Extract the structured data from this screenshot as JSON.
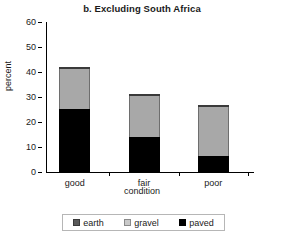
{
  "chart_data": {
    "type": "bar",
    "subtype": "stacked-bar",
    "title": "b. Excluding South Africa",
    "xlabel": "condition",
    "ylabel": "percent",
    "categories": [
      "good",
      "fair",
      "poor"
    ],
    "series": [
      {
        "name": "paved",
        "color": "#000000",
        "values": [
          25.2,
          14.0,
          6.4
        ]
      },
      {
        "name": "gravel",
        "color": "#a8a8a8",
        "values": [
          16.0,
          16.4,
          19.8
        ]
      },
      {
        "name": "earth",
        "color": "#5a5a5a",
        "values": [
          0.8,
          0.8,
          0.8
        ]
      }
    ],
    "totals": [
      42.0,
      31.2,
      27.0
    ],
    "ylim": [
      0,
      60
    ],
    "yticks": [
      0,
      10,
      20,
      30,
      40,
      50,
      60
    ],
    "ytick_labels": [
      "0",
      "10",
      "20",
      "30",
      "40",
      "50",
      "60"
    ],
    "grid": false,
    "legend_position": "bottom",
    "legend_entries": [
      "earth",
      "gravel",
      "paved"
    ]
  },
  "axes": {
    "y_title": "percent",
    "x_title": "condition"
  },
  "legend": {
    "items": [
      {
        "label": "earth",
        "swatch": "earth-swatch-icon"
      },
      {
        "label": "gravel",
        "swatch": "gravel-swatch-icon"
      },
      {
        "label": "paved",
        "swatch": "paved-swatch-icon"
      }
    ]
  }
}
